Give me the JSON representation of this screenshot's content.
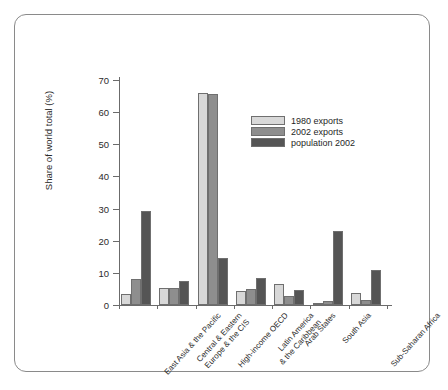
{
  "chart_data": {
    "type": "bar",
    "title": "",
    "subtitle": "",
    "xlabel": "",
    "ylabel": "Share of world total (%)",
    "ylim": [
      0,
      70
    ],
    "yticks": [
      0,
      10,
      20,
      30,
      40,
      50,
      60,
      70
    ],
    "grid": false,
    "legend_position": "upper-center-right",
    "categories": [
      "East Asia & the Pacific",
      "Central & Eastern\nEurope & the CIS",
      "High-income OECD",
      "Latin America\n& the Caribbean",
      "Arab States",
      "South Asia",
      "Sub-Saharan Africa"
    ],
    "category_lines": [
      [
        "East Asia & the Pacific"
      ],
      [
        "Central & Eastern",
        "Europe & the CIS"
      ],
      [
        "High-income OECD"
      ],
      [
        "Latin America",
        "& the Caribbean"
      ],
      [
        "Arab States"
      ],
      [
        "South Asia"
      ],
      [
        "Sub-Saharan Africa"
      ]
    ],
    "series": [
      {
        "name": "1980 exports",
        "color": "#d8d8d8",
        "values": [
          3.5,
          5.4,
          66.0,
          4.4,
          6.5,
          0.7,
          3.6
        ]
      },
      {
        "name": "2002 exports",
        "color": "#8e8e8e",
        "values": [
          8.2,
          5.3,
          65.8,
          4.9,
          2.8,
          1.3,
          1.5
        ]
      },
      {
        "name": "population 2002",
        "color": "#555555",
        "values": [
          29.1,
          7.5,
          14.5,
          8.3,
          4.8,
          23.0,
          10.8
        ]
      }
    ]
  },
  "legend": {
    "items": [
      {
        "label": "1980 exports"
      },
      {
        "label": "2002 exports"
      },
      {
        "label": "population 2002"
      }
    ]
  }
}
